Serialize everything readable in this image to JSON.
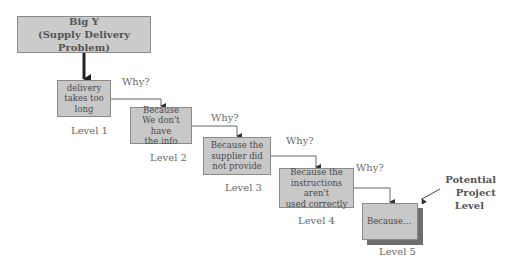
{
  "diagram": {
    "type": "five-whys",
    "root": {
      "line1": "Big Y",
      "line2": "(Supply Delivery Problem)"
    },
    "why_label": "Why?",
    "levels": [
      {
        "label": "Level 1",
        "lines": [
          "delivery",
          "takes too",
          "long"
        ]
      },
      {
        "label": "Level 2",
        "lines": [
          "Because",
          "We don't have",
          "the info"
        ]
      },
      {
        "label": "Level 3",
        "lines": [
          "Because the",
          "supplier did",
          "not provide"
        ]
      },
      {
        "label": "Level 4",
        "lines": [
          "Because the",
          "instructions aren't",
          "used correctly"
        ]
      },
      {
        "label": "Level 5",
        "lines": [
          "Because..."
        ]
      }
    ],
    "annotation": {
      "line1": "Potential Project",
      "line2": "Level"
    },
    "colors": {
      "box_fill": "#c8c8c8",
      "box_border": "#8a8a8a",
      "shadow": "#6e6e6e",
      "text": "#555555"
    }
  }
}
